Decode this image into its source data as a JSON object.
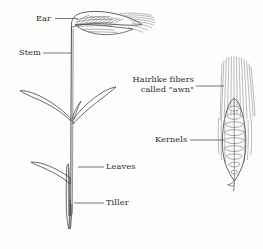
{
  "figure": {
    "kind": "wheat-plant-labeled-diagram",
    "background_color": "#fdfdfc",
    "ink_color": "#3a3a3a",
    "text_color": "#2b2b2b"
  },
  "labels": {
    "ear": "Ear",
    "stem": "Stem",
    "leaves": "Leaves",
    "tiller": "Tiller",
    "awn_line1": "Hairlike fibers",
    "awn_line2": "called \"awn\"",
    "kernels": "Kernels"
  },
  "parts": [
    {
      "name": "ear",
      "label": "Ear",
      "side": "left-plant"
    },
    {
      "name": "stem",
      "label": "Stem",
      "side": "left-plant"
    },
    {
      "name": "leaves",
      "label": "Leaves",
      "side": "left-plant"
    },
    {
      "name": "tiller",
      "label": "Tiller",
      "side": "left-plant"
    },
    {
      "name": "awn",
      "label": "Hairlike fibers called \"awn\"",
      "side": "right-detail"
    },
    {
      "name": "kernels",
      "label": "Kernels",
      "side": "right-detail"
    }
  ]
}
